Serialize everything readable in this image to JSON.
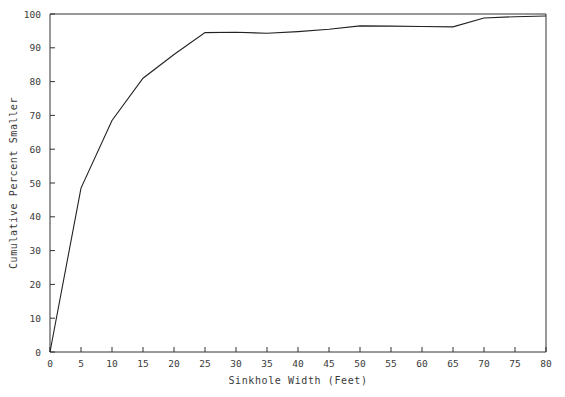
{
  "chart_data": {
    "type": "line",
    "title": "",
    "xlabel": "Sinkhole Width (Feet)",
    "ylabel": "Cumulative Percent Smaller",
    "xlim": [
      0,
      80
    ],
    "ylim": [
      0,
      100
    ],
    "grid": false,
    "legend": null,
    "xticks": [
      0,
      5,
      10,
      15,
      20,
      25,
      30,
      35,
      40,
      45,
      50,
      55,
      60,
      65,
      70,
      75,
      80
    ],
    "xtick_labels": [
      "0",
      "5",
      "10",
      "15",
      "20",
      "25",
      "30",
      "35",
      "40",
      "45",
      "50",
      "55",
      "60",
      "65",
      "70",
      "75",
      "80"
    ],
    "yticks": [
      0,
      10,
      20,
      30,
      40,
      50,
      60,
      70,
      80,
      90,
      100
    ],
    "ytick_labels": [
      "0",
      "10",
      "20",
      "30",
      "40",
      "50",
      "60",
      "70",
      "80",
      "90",
      "100"
    ],
    "series": [
      {
        "name": "Cumulative distribution",
        "x": [
          0,
          5,
          10,
          15,
          20,
          25,
          30,
          35,
          40,
          45,
          50,
          55,
          60,
          65,
          70,
          75,
          80
        ],
        "values": [
          0,
          48.5,
          68.5,
          81,
          88,
          94.5,
          94.6,
          94.3,
          94.8,
          95.5,
          96.5,
          96.4,
          96.3,
          96.2,
          98.8,
          99.2,
          99.4
        ]
      }
    ],
    "line_color": "#222222",
    "background_color": "#ffffff",
    "axis_color": "#333333"
  },
  "axes": {
    "x_title": "Sinkhole Width (Feet)",
    "y_title": "Cumulative Percent Smaller"
  }
}
